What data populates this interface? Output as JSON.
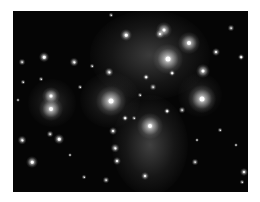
{
  "image": {
    "subject": "Pleiades star cluster (grayscale astrophotograph)",
    "frame": {
      "x": 13,
      "y": 11,
      "width": 235,
      "height": 181
    },
    "background_color": "#050505"
  },
  "nebulae": [
    {
      "x": 150,
      "y": 55,
      "rx": 60,
      "ry": 45,
      "opacity": 0.28
    },
    {
      "x": 150,
      "y": 145,
      "rx": 38,
      "ry": 50,
      "opacity": 0.3
    },
    {
      "x": 110,
      "y": 100,
      "rx": 30,
      "ry": 28,
      "opacity": 0.22
    },
    {
      "x": 52,
      "y": 103,
      "rx": 24,
      "ry": 24,
      "opacity": 0.2
    },
    {
      "x": 200,
      "y": 95,
      "rx": 22,
      "ry": 22,
      "opacity": 0.18
    }
  ],
  "stars": [
    {
      "name": "alcyone",
      "x": 168,
      "y": 59,
      "glow": 30,
      "core": 5
    },
    {
      "name": "atlas",
      "x": 202,
      "y": 99,
      "glow": 28,
      "core": 5
    },
    {
      "name": "electra",
      "x": 111,
      "y": 101,
      "glow": 30,
      "core": 5
    },
    {
      "name": "merope",
      "x": 150,
      "y": 126,
      "glow": 26,
      "core": 4
    },
    {
      "name": "maia",
      "x": 189,
      "y": 43,
      "glow": 22,
      "core": 4
    },
    {
      "name": "taygeta",
      "x": 51,
      "y": 109,
      "glow": 24,
      "core": 4
    },
    {
      "name": "celaeno",
      "x": 51,
      "y": 96,
      "glow": 18,
      "core": 3
    },
    {
      "name": "asterope",
      "x": 164,
      "y": 30,
      "glow": 16,
      "core": 3
    },
    {
      "name": "pleione",
      "x": 203,
      "y": 71,
      "glow": 14,
      "core": 3
    },
    {
      "name": "s1",
      "x": 126,
      "y": 35,
      "glow": 12,
      "core": 2.5
    },
    {
      "name": "s2",
      "x": 160,
      "y": 34,
      "glow": 10,
      "core": 2
    },
    {
      "name": "s3",
      "x": 44,
      "y": 57,
      "glow": 10,
      "core": 2.5
    },
    {
      "name": "s4",
      "x": 74,
      "y": 62,
      "glow": 9,
      "core": 2
    },
    {
      "name": "s5",
      "x": 109,
      "y": 72,
      "glow": 9,
      "core": 2
    },
    {
      "name": "s6",
      "x": 32,
      "y": 162,
      "glow": 12,
      "core": 2.5
    },
    {
      "name": "s7",
      "x": 22,
      "y": 140,
      "glow": 9,
      "core": 2
    },
    {
      "name": "s8",
      "x": 59,
      "y": 139,
      "glow": 10,
      "core": 2.5
    },
    {
      "name": "s9",
      "x": 50,
      "y": 134,
      "glow": 7,
      "core": 1.5
    },
    {
      "name": "s10",
      "x": 115,
      "y": 148,
      "glow": 9,
      "core": 2
    },
    {
      "name": "s11",
      "x": 117,
      "y": 161,
      "glow": 8,
      "core": 2
    },
    {
      "name": "s12",
      "x": 113,
      "y": 131,
      "glow": 8,
      "core": 2
    },
    {
      "name": "s13",
      "x": 106,
      "y": 180,
      "glow": 7,
      "core": 1.5
    },
    {
      "name": "s14",
      "x": 145,
      "y": 176,
      "glow": 8,
      "core": 2
    },
    {
      "name": "s15",
      "x": 22,
      "y": 62,
      "glow": 7,
      "core": 1.5
    },
    {
      "name": "s16",
      "x": 231,
      "y": 28,
      "glow": 7,
      "core": 1.5
    },
    {
      "name": "s17",
      "x": 241,
      "y": 57,
      "glow": 6,
      "core": 1.5
    },
    {
      "name": "s18",
      "x": 216,
      "y": 52,
      "glow": 8,
      "core": 2
    },
    {
      "name": "s19",
      "x": 153,
      "y": 87,
      "glow": 7,
      "core": 1.5
    },
    {
      "name": "s20",
      "x": 146,
      "y": 77,
      "glow": 6,
      "core": 1.5
    },
    {
      "name": "s21",
      "x": 182,
      "y": 110,
      "glow": 7,
      "core": 1.5
    },
    {
      "name": "s22",
      "x": 167,
      "y": 111,
      "glow": 6,
      "core": 1.5
    },
    {
      "name": "s23",
      "x": 125,
      "y": 118,
      "glow": 6,
      "core": 1.5
    },
    {
      "name": "s24",
      "x": 195,
      "y": 162,
      "glow": 7,
      "core": 1.5
    },
    {
      "name": "s25",
      "x": 244,
      "y": 172,
      "glow": 8,
      "core": 2
    },
    {
      "name": "s26",
      "x": 242,
      "y": 182,
      "glow": 5,
      "core": 1
    },
    {
      "name": "s27",
      "x": 111,
      "y": 15,
      "glow": 5,
      "core": 1
    },
    {
      "name": "s28",
      "x": 23,
      "y": 82,
      "glow": 5,
      "core": 1
    },
    {
      "name": "s29",
      "x": 41,
      "y": 79,
      "glow": 5,
      "core": 1
    },
    {
      "name": "s30",
      "x": 80,
      "y": 87,
      "glow": 5,
      "core": 1
    },
    {
      "name": "s31",
      "x": 134,
      "y": 118,
      "glow": 5,
      "core": 1
    },
    {
      "name": "s32",
      "x": 92,
      "y": 66,
      "glow": 5,
      "core": 1
    },
    {
      "name": "s33",
      "x": 172,
      "y": 73,
      "glow": 6,
      "core": 1.5
    },
    {
      "name": "s34",
      "x": 220,
      "y": 130,
      "glow": 5,
      "core": 1
    },
    {
      "name": "s35",
      "x": 84,
      "y": 177,
      "glow": 5,
      "core": 1
    },
    {
      "name": "s36",
      "x": 70,
      "y": 155,
      "glow": 4,
      "core": 1
    },
    {
      "name": "s37",
      "x": 140,
      "y": 95,
      "glow": 5,
      "core": 1
    },
    {
      "name": "s38",
      "x": 197,
      "y": 140,
      "glow": 4,
      "core": 1
    },
    {
      "name": "s39",
      "x": 18,
      "y": 100,
      "glow": 4,
      "core": 1
    },
    {
      "name": "s40",
      "x": 236,
      "y": 145,
      "glow": 4,
      "core": 1
    }
  ]
}
